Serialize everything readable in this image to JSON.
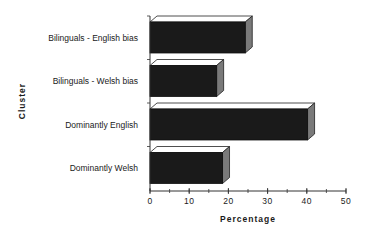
{
  "chart_data": {
    "type": "bar",
    "orientation": "horizontal",
    "style": "3d",
    "title": "",
    "xlabel": "Percentage",
    "ylabel": "Cluster",
    "categories": [
      "Bilinguals - English bias",
      "Bilinguals - Welsh bias",
      "Dominantly English",
      "Dominantly Welsh"
    ],
    "values": [
      24.3,
      17,
      40.2,
      18.5
    ],
    "xlim": [
      0,
      50
    ],
    "xticks": [
      0,
      10,
      20,
      30,
      40,
      50
    ],
    "minor_tick_step": 5,
    "grid": false,
    "legend": null,
    "colors": {
      "bar_front": "#1a1a1a",
      "bar_top": "#ffffff",
      "bar_side": "#7a7a7a",
      "axis": "#333333"
    }
  }
}
